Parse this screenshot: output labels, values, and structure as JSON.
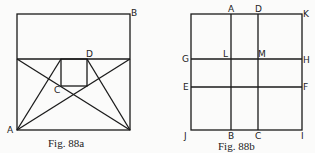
{
  "figures": [
    {
      "id": "88a",
      "caption": "Fig. 88a",
      "points": {
        "A": "A",
        "B": "B",
        "C": "C",
        "D": "D"
      }
    },
    {
      "id": "88b",
      "caption": "Fig. 88b",
      "points": {
        "A": "A",
        "D": "D",
        "K": "K",
        "G": "G",
        "L": "L",
        "M": "M",
        "H": "H",
        "E": "E",
        "F": "F",
        "J": "J",
        "B": "B",
        "C": "C",
        "I": "I"
      }
    }
  ],
  "colors": {
    "line": "#1a1a1a",
    "background": "#fbfbfa"
  }
}
